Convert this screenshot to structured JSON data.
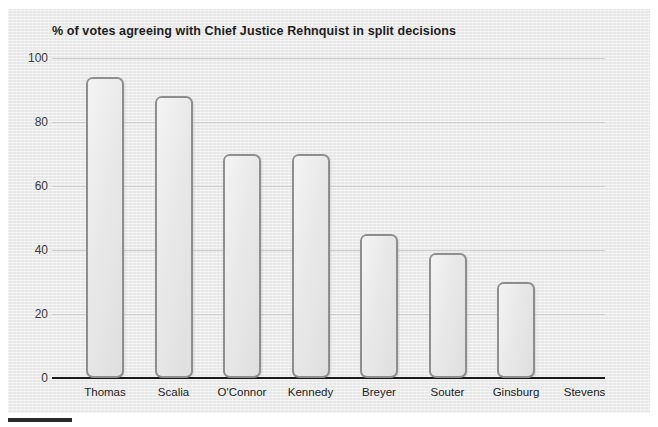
{
  "chart_data": {
    "type": "bar",
    "title": "% of votes agreeing with Chief Justice Rehnquist in split decisions",
    "xlabel": "",
    "ylabel": "",
    "ylim": [
      0,
      100
    ],
    "yticks": [
      0,
      20,
      40,
      60,
      80,
      100
    ],
    "grid": true,
    "legend": false,
    "categories": [
      "Thomas",
      "Scalia",
      "O'Connor",
      "Kennedy",
      "Breyer",
      "Souter",
      "Ginsburg",
      "Stevens"
    ],
    "values": [
      94,
      88,
      70,
      70,
      45,
      39,
      30,
      0
    ],
    "bar_fill_color": "#e6e6e6",
    "bar_border_color": "#8e8e8e",
    "background_color": "#ececec",
    "gridline_color": "#cfcfcf",
    "axis_color": "#1a1a1a"
  },
  "figure": {
    "title": "% of votes agreeing with Chief Justice Rehnquist in split decisions",
    "ytick_labels": [
      "100",
      "80",
      "60",
      "40",
      "20",
      "0"
    ],
    "xtick_labels": [
      "Thomas",
      "Scalia",
      "O'Connor",
      "Kennedy",
      "Breyer",
      "Souter",
      "Ginsburg",
      "Stevens"
    ]
  }
}
